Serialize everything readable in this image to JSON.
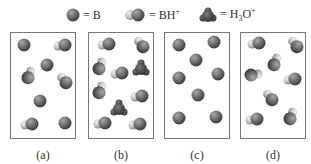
{
  "legend": [
    {
      "symbol": "B",
      "shape": "sphere",
      "text": "= B"
    },
    {
      "symbol": "BH+",
      "shape": "double-sphere",
      "text_main": "= BH",
      "text_sup": "+"
    },
    {
      "symbol": "H3O+",
      "shape": "hydronium",
      "text_main": "= H",
      "text_sub": "3",
      "text_main2": "O",
      "text_sup": "+"
    }
  ],
  "panels": [
    {
      "label": "(a)",
      "particles": [
        {
          "type": "B",
          "x": 13,
          "y": 12
        },
        {
          "type": "BH",
          "x": 52,
          "y": 12,
          "rot": 0
        },
        {
          "type": "B",
          "x": 36,
          "y": 32
        },
        {
          "type": "BH",
          "x": 18,
          "y": 43,
          "rot": 120
        },
        {
          "type": "BH",
          "x": 54,
          "y": 48,
          "rot": 60
        },
        {
          "type": "B",
          "x": 29,
          "y": 68
        },
        {
          "type": "BH",
          "x": 19,
          "y": 91,
          "rot": 0
        },
        {
          "type": "B",
          "x": 54,
          "y": 90
        }
      ]
    },
    {
      "label": "(b)",
      "particles": [
        {
          "type": "BH",
          "x": 18,
          "y": 11,
          "rot": 0
        },
        {
          "type": "BH",
          "x": 53,
          "y": 12,
          "rot": 60
        },
        {
          "type": "BH",
          "x": 11,
          "y": 34,
          "rot": 120
        },
        {
          "type": "H3O",
          "x": 52,
          "y": 35
        },
        {
          "type": "BH",
          "x": 31,
          "y": 40,
          "rot": 0
        },
        {
          "type": "BH",
          "x": 11,
          "y": 58,
          "rot": 120
        },
        {
          "type": "BH",
          "x": 51,
          "y": 63,
          "rot": 0
        },
        {
          "type": "H3O",
          "x": 30,
          "y": 75
        },
        {
          "type": "BH",
          "x": 14,
          "y": 90,
          "rot": 0
        },
        {
          "type": "BH",
          "x": 49,
          "y": 91,
          "rot": 0
        }
      ]
    },
    {
      "label": "(c)",
      "particles": [
        {
          "type": "B",
          "x": 14,
          "y": 12
        },
        {
          "type": "B",
          "x": 49,
          "y": 9
        },
        {
          "type": "B",
          "x": 31,
          "y": 27
        },
        {
          "type": "B",
          "x": 53,
          "y": 41
        },
        {
          "type": "B",
          "x": 14,
          "y": 45
        },
        {
          "type": "B",
          "x": 33,
          "y": 62
        },
        {
          "type": "B",
          "x": 14,
          "y": 85
        },
        {
          "type": "B",
          "x": 51,
          "y": 84
        }
      ]
    },
    {
      "label": "(d)",
      "particles": [
        {
          "type": "BH",
          "x": 16,
          "y": 10,
          "rot": 0
        },
        {
          "type": "BH",
          "x": 55,
          "y": 12,
          "rot": 60
        },
        {
          "type": "BH",
          "x": 34,
          "y": 30,
          "rot": 120
        },
        {
          "type": "BH",
          "x": 12,
          "y": 42,
          "rot": 180
        },
        {
          "type": "BH",
          "x": 52,
          "y": 46,
          "rot": 0
        },
        {
          "type": "BH",
          "x": 30,
          "y": 65,
          "rot": 60
        },
        {
          "type": "BH",
          "x": 14,
          "y": 86,
          "rot": 0
        },
        {
          "type": "BH",
          "x": 50,
          "y": 84,
          "rot": 120
        }
      ]
    }
  ],
  "colors": {
    "sphere": "#6e6e6e",
    "sphere_dark": "#4a4a4a",
    "h_atom": "#c9c9c9",
    "hydronium": "#5a5a5a",
    "border": "#777777"
  }
}
